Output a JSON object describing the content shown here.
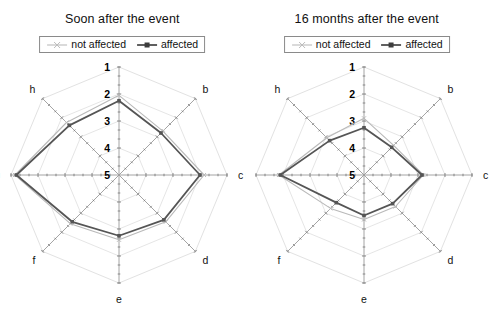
{
  "figure": {
    "background": "#ffffff",
    "panel_count": 2
  },
  "legend": {
    "series": [
      {
        "key": "not_affected",
        "label": "not affected",
        "color": "#b9b9b9",
        "marker": "cross",
        "line_width": 1.1
      },
      {
        "key": "affected",
        "label": "affected",
        "color": "#555555",
        "marker": "square",
        "line_width": 1.8
      }
    ]
  },
  "axes": {
    "letters": [
      "a",
      "b",
      "c",
      "d",
      "e",
      "f",
      "g",
      "h"
    ],
    "ring_labels": [
      "1",
      "2",
      "3",
      "4",
      "5"
    ],
    "ring_values": [
      1,
      2,
      3,
      4,
      5
    ],
    "scale_note_inverted": true,
    "minor_ticks_per_interval": 2,
    "grid_color": "#e2e2e2",
    "spoke_color": "#9a9a9a",
    "tick_color": "#7a7a7a"
  },
  "panels": [
    {
      "id": "soon-after",
      "title": "Soon after the event"
    },
    {
      "id": "sixteen-months-after",
      "title": "16 months after the event"
    }
  ],
  "chart_data": [
    {
      "type": "line",
      "subtype": "radar",
      "title": "Soon after the event",
      "categories": [
        "a",
        "b",
        "c",
        "d",
        "e",
        "f",
        "g",
        "h"
      ],
      "rlim": [
        1,
        5
      ],
      "r_inverted": true,
      "rlabel": "",
      "xlabel": "",
      "ylabel": "",
      "grid": true,
      "legend_position": "top",
      "series": [
        {
          "name": "not affected",
          "color": "#b9b9b9",
          "values": [
            2.05,
            2.7,
            1.85,
            2.55,
            2.6,
            2.45,
            1.15,
            2.25
          ]
        },
        {
          "name": "affected",
          "color": "#555555",
          "values": [
            2.25,
            2.8,
            2.0,
            2.65,
            2.75,
            2.55,
            1.2,
            2.4
          ]
        }
      ]
    },
    {
      "type": "line",
      "subtype": "radar",
      "title": "16 months after the event",
      "categories": [
        "a",
        "b",
        "c",
        "d",
        "e",
        "f",
        "g",
        "h"
      ],
      "rlim": [
        1,
        5
      ],
      "r_inverted": true,
      "rlabel": "",
      "xlabel": "",
      "ylabel": "",
      "grid": true,
      "legend_position": "top",
      "series": [
        {
          "name": "not affected",
          "color": "#b9b9b9",
          "values": [
            2.9,
            3.45,
            2.8,
            3.35,
            3.35,
            3.25,
            1.85,
            3.05
          ]
        },
        {
          "name": "affected",
          "color": "#555555",
          "values": [
            3.25,
            3.55,
            2.85,
            3.5,
            3.5,
            3.55,
            1.9,
            3.2
          ]
        }
      ]
    }
  ]
}
